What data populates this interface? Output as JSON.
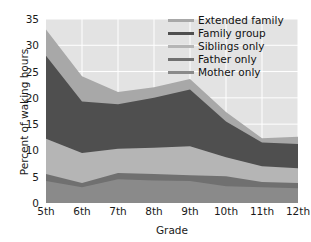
{
  "chart_data": {
    "type": "area",
    "stacked": true,
    "title": "",
    "xlabel": "Grade",
    "ylabel": "Percent of waking hours",
    "categories": [
      "5th",
      "6th",
      "7th",
      "8th",
      "9th",
      "10th",
      "11th",
      "12th"
    ],
    "ylim": [
      0,
      35
    ],
    "yticks": [
      0,
      5,
      10,
      15,
      20,
      25,
      30,
      35
    ],
    "grid": true,
    "legend_position": "top-right",
    "series": [
      {
        "name": "Mother only",
        "color": "#8a8a8a",
        "values": [
          4.2,
          3.0,
          4.5,
          4.3,
          4.2,
          3.2,
          3.0,
          2.8
        ]
      },
      {
        "name": "Father only",
        "color": "#707070",
        "values": [
          1.3,
          0.8,
          1.2,
          1.2,
          1.1,
          1.9,
          1.0,
          1.0
        ]
      },
      {
        "name": "Siblings only",
        "color": "#b5b5b5",
        "values": [
          6.7,
          5.7,
          4.6,
          5.0,
          5.5,
          3.6,
          3.0,
          2.8
        ]
      },
      {
        "name": "Family group",
        "color": "#4f4f4f",
        "values": [
          15.8,
          9.8,
          8.5,
          9.5,
          10.8,
          6.8,
          4.5,
          4.6
        ]
      },
      {
        "name": "Extended family",
        "color": "#a8a8a8",
        "values": [
          5.0,
          4.8,
          2.3,
          2.0,
          2.0,
          1.8,
          0.8,
          1.4
        ]
      }
    ],
    "cumulative": {
      "mother_only": [
        4.2,
        3.0,
        4.5,
        4.3,
        4.2,
        3.2,
        3.0,
        2.8
      ],
      "father_only": [
        5.5,
        3.8,
        5.7,
        5.5,
        5.3,
        5.1,
        4.0,
        3.8
      ],
      "siblings_only": [
        12.2,
        9.5,
        10.3,
        10.5,
        10.8,
        8.7,
        7.0,
        6.6
      ],
      "family_group": [
        28.0,
        19.3,
        18.8,
        20.0,
        21.6,
        15.5,
        11.5,
        11.2
      ],
      "extended_family": [
        33.0,
        24.1,
        21.1,
        22.0,
        23.6,
        17.3,
        12.3,
        12.6
      ]
    }
  },
  "axes": {
    "y_title": "Percent of waking hours",
    "x_title": "Grade",
    "y_tick_labels": [
      "35",
      "30",
      "25",
      "20",
      "15",
      "10",
      "5",
      "0"
    ],
    "x_tick_labels": [
      "5th",
      "6th",
      "7th",
      "8th",
      "9th",
      "10th",
      "11th",
      "12th"
    ]
  },
  "legend": {
    "items": [
      {
        "label": "Extended family",
        "color": "#a8a8a8"
      },
      {
        "label": "Family group",
        "color": "#4f4f4f"
      },
      {
        "label": "Siblings only",
        "color": "#b5b5b5"
      },
      {
        "label": "Father only",
        "color": "#707070"
      },
      {
        "label": "Mother only",
        "color": "#8a8a8a"
      }
    ]
  },
  "style": {
    "plot_background": "#e3e3e3",
    "grid_color": "#ffffff",
    "text_color": "#1a1a1a"
  }
}
